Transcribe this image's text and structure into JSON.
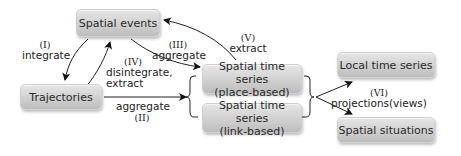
{
  "nodes": {
    "spatial_events": "Spatial events",
    "trajectories": "Trajectories",
    "sts_place_line1": "Spatial time series",
    "sts_place_line2": "(place-based)",
    "sts_link_line1": "Spatial time series",
    "sts_link_line2": "(link-based)",
    "local_time_series": "Local time series",
    "spatial_situations": "Spatial situations"
  },
  "edges": {
    "I": {
      "num": "(I)",
      "label": "integrate"
    },
    "II": {
      "num": "(II)",
      "label": "aggregate"
    },
    "III": {
      "num": "(III)",
      "label": "aggregate"
    },
    "IV": {
      "num": "(IV)",
      "label1": "disintegrate,",
      "label2": "extract"
    },
    "V": {
      "num": "(V)",
      "label": "extract"
    },
    "VI": {
      "num": "(VI)",
      "label": "projections(views)"
    }
  }
}
